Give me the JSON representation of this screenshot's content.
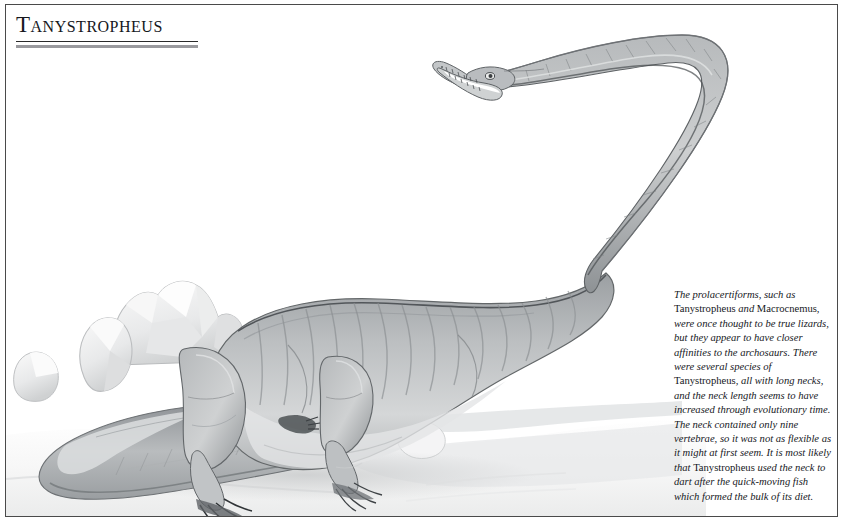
{
  "page": {
    "background_color": "#ffffff",
    "border_color": "#4a4a4a"
  },
  "header": {
    "title": "Tanystropheus",
    "rule_thin_color": "#2b2b2b",
    "rule_thick_color": "#9a9a9e"
  },
  "caption": {
    "segments": [
      {
        "text": "The prolacertiforms, such as ",
        "style": "italic"
      },
      {
        "text": "Tanystropheus",
        "style": "roman"
      },
      {
        "text": " and ",
        "style": "italic"
      },
      {
        "text": "Macrocnemus",
        "style": "roman"
      },
      {
        "text": ", were once thought to be true lizards, but they appear to have closer affinities to the archosaurs. There were several species of ",
        "style": "italic"
      },
      {
        "text": "Tanystropheus",
        "style": "roman"
      },
      {
        "text": ", all with long necks, and the neck length seems to have increased through evolutionary time. The neck contained only nine vertebrae, so it was not as flexible as it might at first seem. It is most likely that ",
        "style": "italic"
      },
      {
        "text": "Tanystropheus",
        "style": "roman"
      },
      {
        "text": " used the neck to dart after the quick-moving fish which formed the bulk of its diet.",
        "style": "italic"
      }
    ],
    "full_text": "The prolacertiforms, such as Tanystropheus and Macrocnemus, were once thought to be true lizards, but they appear to have closer affinities to the archosaurs. There were several species of Tanystropheus, all with long necks, and the neck length seems to have increased through evolutionary time. The neck contained only nine vertebrae, so it was not as flexible as it might at first seem. It is most likely that Tanystropheus used the neck to dart after the quick-moving fish which formed the bulk of its diet."
  },
  "illustration": {
    "subject": "Tanystropheus",
    "description": "Pencil illustration of a long-necked prolacertiform reptile lying on sandy ground with rocks behind it, its extremely long neck arcing up and to the right, head with open toothed jaws at top centre, long tail curling around the bottom left.",
    "medium": "graphite pencil drawing",
    "palette": {
      "body_light": "#cfd1d2",
      "body_mid": "#a8abad",
      "body_dark": "#7e8285",
      "outline": "#565a5d",
      "rock_light": "#f1f1f1",
      "rock_shade": "#d2d4d5",
      "ground_shade": "#e6e7e8",
      "paper": "#ffffff"
    },
    "parts": [
      "head-with-open-jaws",
      "long-curving-neck",
      "torso",
      "fore-limb",
      "hind-limb",
      "clawed-feet",
      "long-tail",
      "background-rocks",
      "ground"
    ]
  }
}
